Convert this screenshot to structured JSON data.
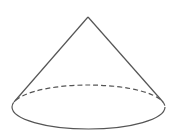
{
  "diagram": {
    "type": "geometric-solid",
    "shape": "cone",
    "width": 170,
    "height": 140,
    "background": "#ffffff",
    "stroke_color": "#555555",
    "stroke_width": 1.2,
    "apex": {
      "x": 88,
      "y": 17
    },
    "base_ellipse": {
      "cx": 88.5,
      "cy": 107,
      "rx": 76.5,
      "ry": 22
    },
    "left_tangent": {
      "x": 14,
      "y": 102
    },
    "right_tangent": {
      "x": 163,
      "y": 102
    },
    "hidden_edge_style": "dashed",
    "dash_pattern": "5,3"
  }
}
